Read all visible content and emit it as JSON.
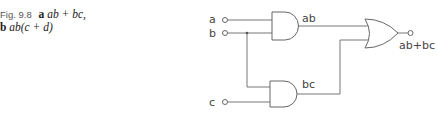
{
  "caption": {
    "figure": "Fig. 9.8",
    "part_a_letter": "a",
    "part_a_expr": "ab + bc,",
    "part_b_letter": "b",
    "part_b_expr": "ab(c + d)"
  },
  "diagram": {
    "inputs": [
      {
        "label": "a"
      },
      {
        "label": "b"
      },
      {
        "label": "c"
      }
    ],
    "gates": [
      {
        "type": "AND",
        "output_label": "ab"
      },
      {
        "type": "AND",
        "output_label": "bc"
      },
      {
        "type": "OR",
        "output_label": "ab+bc"
      }
    ]
  }
}
